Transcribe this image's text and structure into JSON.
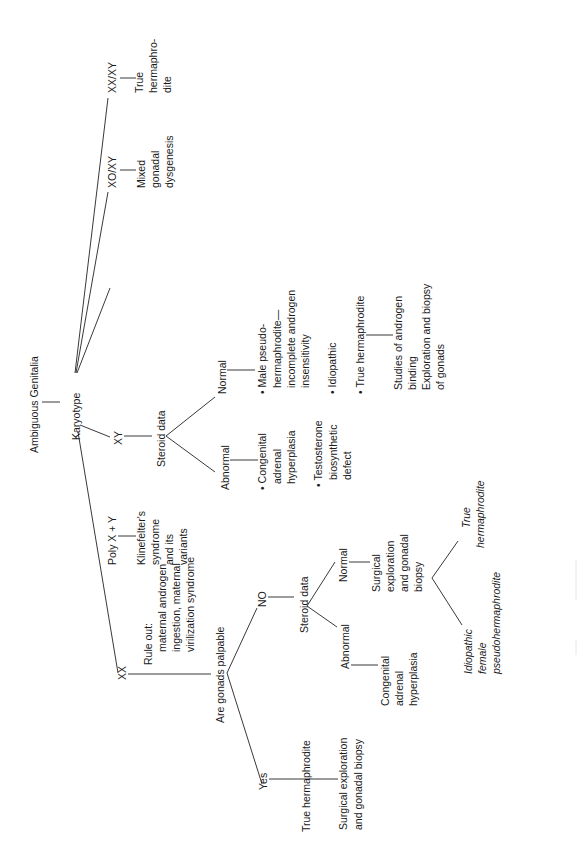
{
  "diagram": {
    "title": "Ambiguous Genitalia",
    "root_test": "Karyotype",
    "branches": {
      "xx": {
        "label": "XX",
        "rule_out": [
          "Rule out:",
          "maternal androgen",
          "ingestion, maternal",
          "virilization syndrome"
        ],
        "question": "Are gonads palpable",
        "yes": {
          "label": "Yes",
          "result": "True hermaphrodite",
          "action": [
            "Surgical exploration",
            "and gonadal biopsy"
          ]
        },
        "no": {
          "label": "NO",
          "test": "Steroid data",
          "abnormal": {
            "label": "Abnormal",
            "result": [
              "Congenital",
              "adrenal",
              "hyperplasia"
            ]
          },
          "normal": {
            "label": "Normal",
            "action": [
              "Surgical",
              "exploration",
              "and gonadal",
              "biopsy"
            ],
            "outcome_a": [
              "Idiopathic",
              "female",
              "pseudohermaphrodite"
            ],
            "outcome_b": [
              "True",
              "hermaphrodite"
            ]
          }
        }
      },
      "xy": {
        "label": "XY",
        "test": "Steroid data",
        "abnormal": {
          "label": "Abnormal",
          "item1": [
            "• Congenital",
            "adrenal",
            "hyperplasia"
          ],
          "item2": [
            "• Testosterone",
            "biosynthetic",
            "defect"
          ]
        },
        "normal": {
          "label": "Normal",
          "item1": [
            "• Male pseudo-",
            "hermaphrodite—",
            "incomplete androgen",
            "insensitivity"
          ],
          "item2": [
            "• Idiopathic"
          ],
          "item3": [
            "• True hermaphrodite"
          ],
          "action": [
            "Studies of androgen",
            "binding",
            "Exploration and biopsy",
            "of gonads"
          ]
        }
      },
      "poly": {
        "label": "Poly X + Y",
        "result": [
          "Klinefelter's",
          "syndrome",
          "and its",
          "variants"
        ]
      },
      "xoxy": {
        "label": "XO/XY",
        "result": [
          "Mixed",
          "gonadal",
          "dysgenesis"
        ]
      },
      "xxxy": {
        "label": "XX/XY",
        "result": [
          "True",
          "hermaphro-",
          "dite"
        ]
      }
    }
  }
}
